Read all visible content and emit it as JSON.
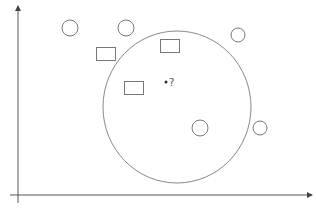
{
  "diagram": {
    "type": "scatter-with-region",
    "colors": {
      "stroke": "#777777",
      "axis": "#555555",
      "background": "#ffffff"
    },
    "axes": {
      "x_axis": {
        "x1": 10,
        "y1": 195,
        "x2": 312,
        "y2": 195
      },
      "y_axis": {
        "x1": 18,
        "y1": 203,
        "x2": 18,
        "y2": 6
      }
    },
    "region": {
      "cx": 177,
      "cy": 107,
      "rx": 74,
      "ry": 76
    },
    "circles": [
      {
        "cx": 70,
        "cy": 28,
        "r": 8
      },
      {
        "cx": 126,
        "cy": 28,
        "r": 8
      },
      {
        "cx": 238,
        "cy": 35,
        "r": 7
      },
      {
        "cx": 200,
        "cy": 128,
        "r": 8
      },
      {
        "cx": 260,
        "cy": 128,
        "r": 7
      }
    ],
    "rectangles": [
      {
        "x": 96,
        "y": 47,
        "w": 19,
        "h": 13
      },
      {
        "x": 160,
        "y": 39,
        "w": 19,
        "h": 13
      },
      {
        "x": 124,
        "y": 81,
        "w": 19,
        "h": 13
      }
    ],
    "query_point": {
      "cx": 166,
      "cy": 82,
      "r": 1.5,
      "label": "?"
    }
  }
}
